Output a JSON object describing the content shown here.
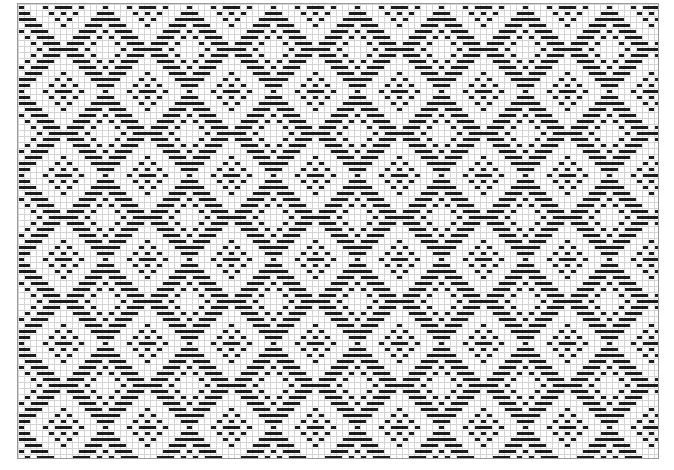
{
  "draft": {
    "type": "weave-drawdown",
    "cols": 107,
    "rows": 76,
    "cell_px": 6,
    "bar_height_px": 3,
    "colors": {
      "warp_float": "#1c1c1c",
      "grid_line": "#d4d4d4",
      "border": "#9a9a9a",
      "background": "#ffffff"
    },
    "threading": {
      "kind": "point",
      "shafts": 8,
      "repeat": 14
    },
    "treadling": {
      "kind": "point",
      "treadles": 8,
      "repeat": 14
    },
    "tieup": [
      [
        1,
        1,
        1,
        0,
        1,
        0,
        0,
        0
      ],
      [
        0,
        1,
        1,
        1,
        0,
        1,
        0,
        0
      ],
      [
        0,
        0,
        1,
        1,
        1,
        0,
        1,
        0
      ],
      [
        0,
        0,
        0,
        1,
        1,
        1,
        0,
        1
      ],
      [
        1,
        0,
        0,
        0,
        1,
        1,
        1,
        0
      ],
      [
        0,
        1,
        0,
        0,
        0,
        1,
        1,
        1
      ],
      [
        1,
        0,
        1,
        0,
        0,
        0,
        1,
        1
      ],
      [
        1,
        1,
        0,
        1,
        0,
        0,
        0,
        1
      ]
    ]
  }
}
